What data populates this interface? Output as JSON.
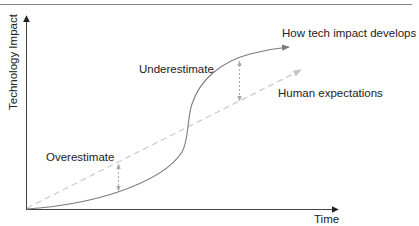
{
  "diagram": {
    "title": "",
    "axes": {
      "x_label": "Time",
      "y_label": "Technology Impact"
    },
    "series": {
      "actual": {
        "label": "How tech impact develops",
        "style": "solid S-curve",
        "color": "#7a7a7a"
      },
      "expected": {
        "label": "Human expectations",
        "style": "dashed straight line",
        "color": "#c8c8c8"
      }
    },
    "annotations": {
      "overestimate": "Overestimate",
      "underestimate": "Underestimate"
    },
    "colors": {
      "axis": "#444444",
      "text": "#222222",
      "gap_arrow": "#aaaaaa",
      "top_rule": "#888888"
    }
  }
}
